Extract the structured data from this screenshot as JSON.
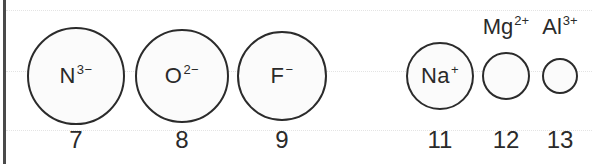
{
  "diagram": {
    "type": "ionic-radii-comparison",
    "ions": [
      {
        "symbol": "N",
        "charge": "3−",
        "atomic_number": "7",
        "label_position": "inside",
        "center_x": 76,
        "radius": 49
      },
      {
        "symbol": "O",
        "charge": "2−",
        "atomic_number": "8",
        "label_position": "inside",
        "center_x": 182,
        "radius": 47
      },
      {
        "symbol": "F",
        "charge": "−",
        "atomic_number": "9",
        "label_position": "inside",
        "center_x": 282,
        "radius": 45
      },
      {
        "symbol": "Na",
        "charge": "+",
        "atomic_number": "11",
        "label_position": "inside",
        "center_x": 440,
        "radius": 34
      },
      {
        "symbol": "Mg",
        "charge": "2+",
        "atomic_number": "12",
        "label_position": "above",
        "center_x": 506,
        "radius": 24
      },
      {
        "symbol": "Al",
        "charge": "3+",
        "atomic_number": "13",
        "label_position": "above",
        "center_x": 560,
        "radius": 18
      }
    ],
    "colors": {
      "stroke": "#2b2b2b",
      "fill": "#fbfbfb",
      "frame": "#4a4a4a",
      "guide": "#e4e4e4"
    }
  }
}
